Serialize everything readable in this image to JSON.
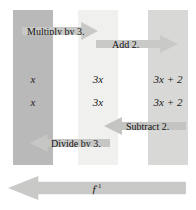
{
  "diagram": {
    "bands": [
      {
        "name": "input-column",
        "value_top": "x",
        "value_bottom": "x",
        "color": "#b9b9b9"
      },
      {
        "name": "middle-column",
        "value_top": "3x",
        "value_bottom": "3x",
        "color": "#f0f0ee"
      },
      {
        "name": "output-column",
        "value_top": "3x + 2",
        "value_bottom": "3x + 2",
        "color": "#d8d8d6"
      }
    ],
    "arrows": [
      {
        "name": "multiply-by-3",
        "label": "Multiply by 3.",
        "direction": "right",
        "color": "#c8c8c6"
      },
      {
        "name": "add-2",
        "label": "Add 2.",
        "direction": "right",
        "color": "#c9c9c7"
      },
      {
        "name": "subtract-2",
        "label": "Subtract 2.",
        "direction": "left",
        "color": "#c4c4c2"
      },
      {
        "name": "divide-by-3",
        "label": "Divide by 3.",
        "direction": "left",
        "color": "#c6c6c4"
      },
      {
        "name": "inverse",
        "label": "f",
        "superscript": "-1",
        "direction": "left",
        "color": "#c9c9c7"
      }
    ]
  }
}
